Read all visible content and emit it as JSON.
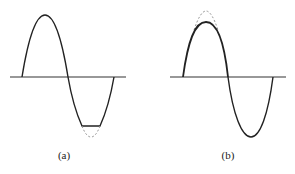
{
  "figure": {
    "panels": [
      {
        "id": "a",
        "caption": "(a)",
        "description": "Sine wave with negative half-cycle clipped flat; dashed line shows unclipped trough",
        "clipping": "negative peak"
      },
      {
        "id": "b",
        "caption": "(b)",
        "description": "Sine wave with positive half-cycle compressed/rounded; dashed line shows unclipped peak",
        "clipping": "positive peak"
      }
    ],
    "colors": {
      "stroke": "#222222",
      "dashed": "#999999",
      "background": "#ffffff"
    }
  }
}
